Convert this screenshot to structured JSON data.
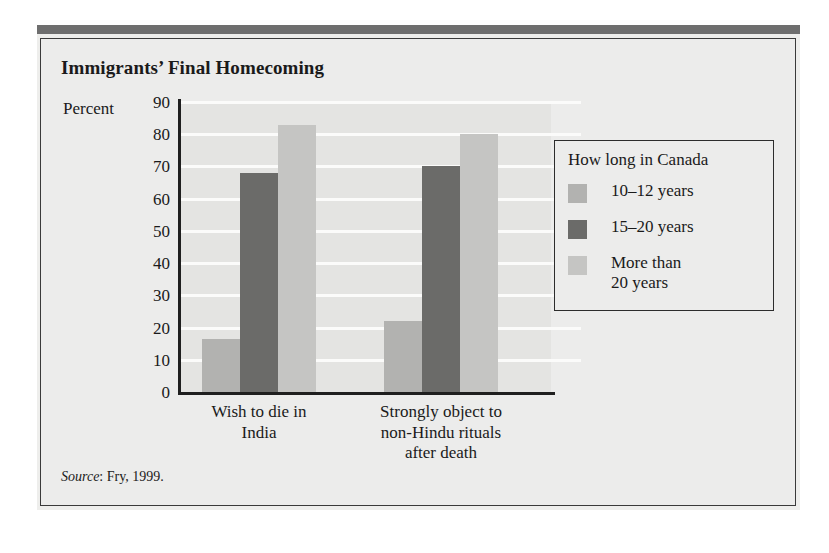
{
  "figure": {
    "title": "Immigrants’ Final Homecoming",
    "source_word": "Source",
    "source_rest": ": Fry, 1999."
  },
  "colors": {
    "series_10_12": "#b2b2b0",
    "series_15_20": "#6b6b69",
    "series_more_20": "#c5c5c3",
    "plot_background": "#e4e4e2",
    "gridline": "#fbfbfa",
    "axis": "#1f1f1f",
    "panel_background": "#ececeb",
    "top_rule": "#6e6e6e"
  },
  "legend": {
    "title": "How long in Canada",
    "entries": [
      {
        "label": "10–12 years",
        "color": "#b2b2b0"
      },
      {
        "label": "15–20 years",
        "color": "#6b6b69"
      },
      {
        "label": "More than\n20 years",
        "color": "#c5c5c3"
      }
    ]
  },
  "chart_data": {
    "type": "bar",
    "title": "Immigrants’ Final Homecoming",
    "xlabel": "",
    "ylabel": "Percent",
    "ylim": [
      0,
      90
    ],
    "ytick_labels": [
      "90",
      "80",
      "70",
      "60",
      "50",
      "40",
      "30",
      "20",
      "10",
      "0"
    ],
    "yticks": [
      90,
      80,
      70,
      60,
      50,
      40,
      30,
      20,
      10,
      0
    ],
    "grid": true,
    "legend_position": "right-outside",
    "categories": [
      "Wish to die in\nIndia",
      "Strongly object to\nnon-Hindu rituals\nafter death"
    ],
    "series": [
      {
        "name": "10–12 years",
        "values": [
          16.5,
          22
        ]
      },
      {
        "name": "15–20 years",
        "values": [
          68,
          70
        ]
      },
      {
        "name": "More than 20 years",
        "values": [
          83,
          80
        ]
      }
    ],
    "annotations": [
      "Source: Fry, 1999."
    ]
  }
}
